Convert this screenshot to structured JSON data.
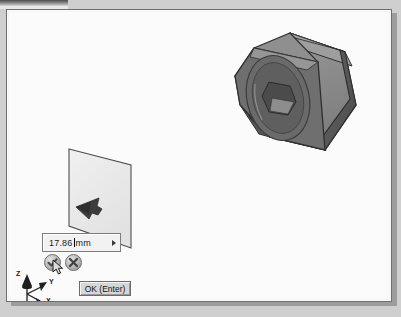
{
  "app": {
    "type": "cad-3d-modeler",
    "background_color": "#cfcfcf",
    "canvas_color": "#fbfbfb"
  },
  "value_input": {
    "name": "extrude-distance-input",
    "value": "17.86",
    "unit": "mm",
    "has_caret": true,
    "expand_arrow_icon": "chevron-right-icon"
  },
  "mini_toolbar": {
    "accept_label": "accept-checkmark",
    "cancel_label": "cancel-x",
    "accept_color": "#7a7a7a",
    "cancel_color": "#6a6a6a"
  },
  "ok_button": {
    "label": "OK (Enter)"
  },
  "axis_triad": {
    "z_label": "Z",
    "y_label": "Y",
    "x_label": "X"
  },
  "model": {
    "name": "hex-nut",
    "description": "hexagonal nut with chamfered circular face and hex socket",
    "face_top_color": "#8c8c8c",
    "face_right_color": "#5c5c5c",
    "face_front_color": "#6e6e6e",
    "outline_color": "#2b2b2b"
  },
  "sketch_plane": {
    "name": "extrude-preview-plane",
    "fill_color": "#ececec",
    "edge_color": "#4f4f4f",
    "direction_arrow_icon": "direction-arrow-icon"
  }
}
